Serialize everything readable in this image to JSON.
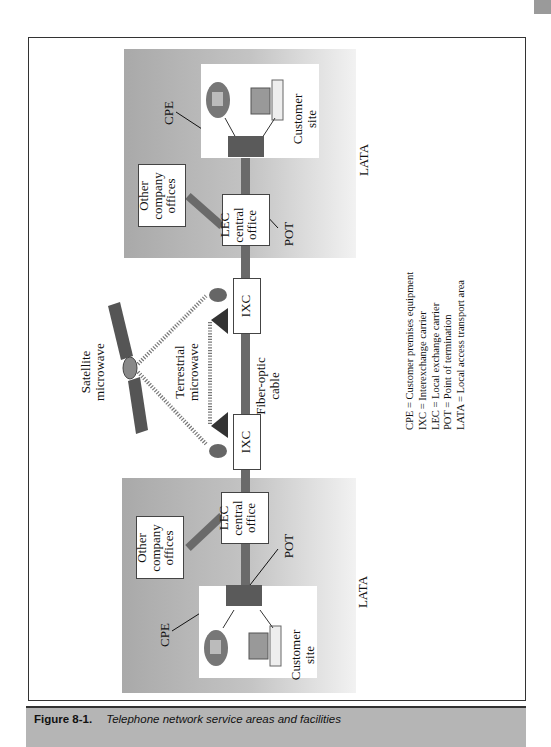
{
  "figure": {
    "number": "Figure 8-1.",
    "title": "Telephone network service areas and facilities"
  },
  "diagram": {
    "lata_label": "LATA",
    "top_area": {
      "cpe_label": "CPE",
      "pot_label": "POT",
      "customer_site": [
        "Customer",
        "site"
      ],
      "lec": [
        "LEC",
        "central",
        "office"
      ],
      "other_offices": [
        "Other",
        "company",
        "offices"
      ]
    },
    "bottom_area": {
      "cpe_label": "CPE",
      "pot_label": "POT",
      "customer_site": [
        "Customer",
        "site"
      ],
      "lec": [
        "LEC",
        "central",
        "office"
      ],
      "other_offices": [
        "Other",
        "company",
        "offices"
      ]
    },
    "ixc_label": "IXC",
    "satellite": [
      "Satellite",
      "microwave"
    ],
    "terrestrial": [
      "Terrestrial",
      "microwave"
    ],
    "fiber": [
      "Fiber-optic",
      "cable"
    ],
    "legend": [
      "CPE = Customer premises equipment",
      "IXC = Interexchange carrier",
      "LEC = Local exchange carrier",
      "POT = Point of termination",
      "LATA = Local access transport area"
    ]
  },
  "colors": {
    "caption_bar": "#b5b5b5",
    "cpe_box": "#5a5a5a",
    "trunk_line": "#6a6a6a"
  }
}
